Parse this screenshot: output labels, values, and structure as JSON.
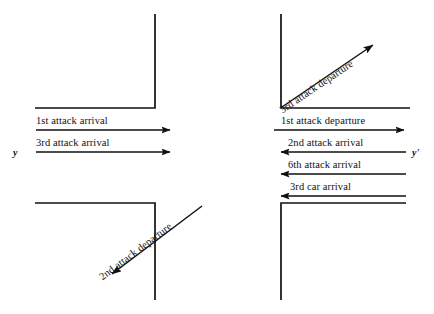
{
  "figure": {
    "type": "spacetime-diagram",
    "background_color": "#ffffff",
    "line_color": "#111111",
    "axis_labels": [
      {
        "name": "y-axis-label",
        "text": "y",
        "x": 13,
        "y": 158
      },
      {
        "name": "y-prime-axis-label",
        "text": "y'",
        "x": 412,
        "y": 158
      }
    ],
    "left_panel": {
      "horizontal_arrows": [
        {
          "name": "arrow-1st-attack-arrival",
          "label": "1st attack arrival",
          "direction": "right",
          "line_y": 130,
          "x_start": 36,
          "x_end": 176,
          "label_x": 36,
          "label_y": 117
        },
        {
          "name": "arrow-3rd-attack-arrival",
          "label": "3rd attack arrival",
          "direction": "right",
          "line_y": 152,
          "x_start": 36,
          "x_end": 176,
          "label_x": 36,
          "label_y": 139
        }
      ],
      "diagonal_arrows": [
        {
          "name": "arrow-2nd-attack-departure",
          "label": "2nd attack departure",
          "direction": "down-left",
          "x1": 202,
          "y1": 206,
          "x2": 106,
          "y2": 279
        }
      ]
    },
    "right_panel": {
      "horizontal_arrows": [
        {
          "name": "arrow-1st-attack-departure",
          "label": "1st attack departure",
          "direction": "right",
          "line_y": 130,
          "x_start": 274,
          "x_end": 410,
          "label_x": 281,
          "label_y": 117
        },
        {
          "name": "arrow-2nd-attack-arrival",
          "label": "2nd attack arrival",
          "direction": "left",
          "line_y": 152,
          "x_start": 274,
          "x_end": 406,
          "label_x": 285,
          "label_y": 139
        },
        {
          "name": "arrow-6th-attack-arrival",
          "label": "6th attack arrival",
          "direction": "left",
          "line_y": 174,
          "x_start": 274,
          "x_end": 406,
          "label_x": 285,
          "label_y": 161
        },
        {
          "name": "arrow-3rd-car-arrival",
          "label": "3rd car arrival",
          "direction": "left",
          "line_y": 196,
          "x_start": 274,
          "x_end": 406,
          "label_x": 285,
          "label_y": 183
        }
      ],
      "diagonal_arrows": [
        {
          "name": "arrow-3rd-attack-departure",
          "label": "3rd attack departure",
          "direction": "up-right",
          "x1": 282,
          "y1": 107,
          "x2": 379,
          "y2": 41
        }
      ]
    },
    "worldlines": [
      {
        "name": "worldline-top-left",
        "points": "35,108 155,108 155,14"
      },
      {
        "name": "worldline-bottom-left",
        "points": "35,203 155,203 155,300"
      },
      {
        "name": "worldline-top-right",
        "points": "410,108 281,108 281,14"
      },
      {
        "name": "worldline-bottom-right",
        "points": "406,203 281,203 281,300"
      }
    ]
  }
}
